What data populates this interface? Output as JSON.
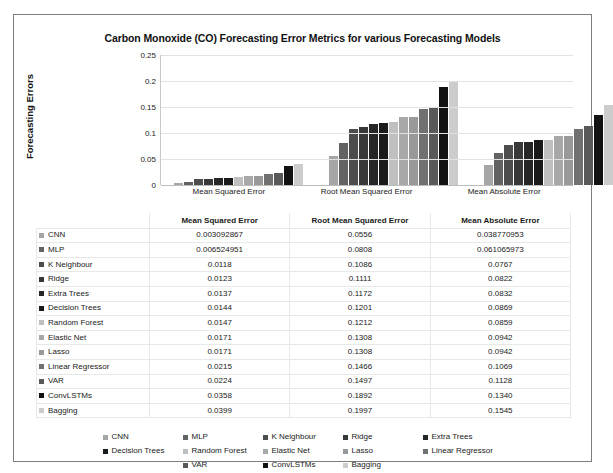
{
  "chart_data": {
    "type": "bar",
    "title": "Carbon Monoxide (CO) Forecasting Error Metrics for various Forecasting Models",
    "xlabel": "",
    "ylabel": "Forecasting Errors",
    "ylim": [
      0,
      0.25
    ],
    "yticks": [
      "0",
      "0.05",
      "0.1",
      "0.15",
      "0.2",
      "0.25"
    ],
    "ytick_values": [
      0,
      0.05,
      0.1,
      0.15,
      0.2,
      0.25
    ],
    "grid": true,
    "legend_position": "bottom",
    "categories": [
      "Mean Squared Error",
      "Root Mean Squared Error",
      "Mean Absolute Error"
    ],
    "series": [
      {
        "name": "CNN",
        "color": "#a6a6a6",
        "values": [
          0.003092867,
          0.0556,
          0.038770953
        ],
        "display": [
          "0.003092867",
          "0.0556",
          "0.038770953"
        ]
      },
      {
        "name": "MLP",
        "color": "#636363",
        "values": [
          0.006524951,
          0.0808,
          0.061065973
        ],
        "display": [
          "0.006524951",
          "0.0808",
          "0.061065973"
        ]
      },
      {
        "name": "K Neighbour",
        "color": "#4d4d4d",
        "values": [
          0.0118,
          0.1086,
          0.0767
        ],
        "display": [
          "0.0118",
          "0.1086",
          "0.0767"
        ]
      },
      {
        "name": "Ridge",
        "color": "#383838",
        "values": [
          0.0123,
          0.1111,
          0.0822
        ],
        "display": [
          "0.0123",
          "0.1111",
          "0.0822"
        ]
      },
      {
        "name": "Extra Trees",
        "color": "#262626",
        "values": [
          0.0137,
          0.1172,
          0.0832
        ],
        "display": [
          "0.0137",
          "0.1172",
          "0.0832"
        ]
      },
      {
        "name": "Decision Trees",
        "color": "#1a1a1a",
        "values": [
          0.0144,
          0.1201,
          0.0869
        ],
        "display": [
          "0.0144",
          "0.1201",
          "0.0869"
        ]
      },
      {
        "name": "Random Forest",
        "color": "#bfbfbf",
        "values": [
          0.0147,
          0.1212,
          0.0859
        ],
        "display": [
          "0.0147",
          "0.1212",
          "0.0859"
        ]
      },
      {
        "name": "Elastic Net",
        "color": "#a8a8a8",
        "values": [
          0.0171,
          0.1308,
          0.0942
        ],
        "display": [
          "0.0171",
          "0.1308",
          "0.0942"
        ]
      },
      {
        "name": "Lasso",
        "color": "#999999",
        "values": [
          0.0171,
          0.1308,
          0.0942
        ],
        "display": [
          "0.0171",
          "0.1308",
          "0.0942"
        ]
      },
      {
        "name": "Linear Regressor",
        "color": "#707070",
        "values": [
          0.0215,
          0.1466,
          0.1069
        ],
        "display": [
          "0.0215",
          "0.1466",
          "0.1069"
        ]
      },
      {
        "name": "VAR",
        "color": "#595959",
        "values": [
          0.0224,
          0.1497,
          0.1128
        ],
        "display": [
          "0.0224",
          "0.1497",
          "0.1128"
        ]
      },
      {
        "name": "ConvLSTMs",
        "color": "#121212",
        "values": [
          0.0358,
          0.1892,
          0.134
        ],
        "display": [
          "0.0358",
          "0.1892",
          "0.1340"
        ]
      },
      {
        "name": "Bagging",
        "color": "#cccccc",
        "values": [
          0.0399,
          0.1997,
          0.1545
        ],
        "display": [
          "0.0399",
          "0.1997",
          "0.1545"
        ]
      }
    ]
  },
  "table": {
    "headers": [
      "",
      "Mean Squared Error",
      "Root Mean Squared Error",
      "Mean Absolute Error"
    ]
  }
}
